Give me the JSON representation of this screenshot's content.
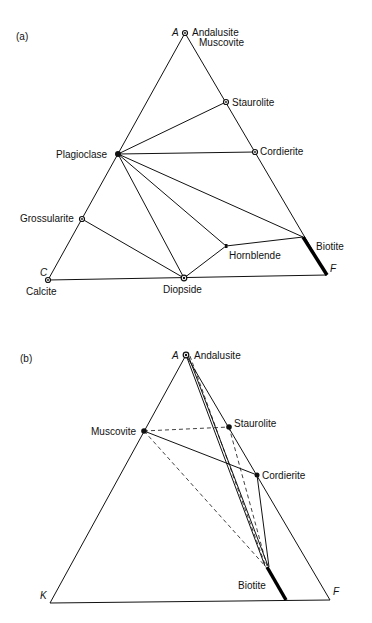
{
  "diagrams": [
    {
      "panel_label": "(a)",
      "vertices": {
        "top": "A",
        "left": "C",
        "right": "F"
      },
      "labels": {
        "andalusite": "Andalusite",
        "muscovite": "Muscovite",
        "staurolite": "Staurolite",
        "cordierite": "Cordierite",
        "plagioclase": "Plagioclase",
        "grossularite": "Grossularite",
        "hornblende": "Hornblende",
        "biotite": "Biotite",
        "calcite": "Calcite",
        "diopside": "Diopside"
      }
    },
    {
      "panel_label": "(b)",
      "vertices": {
        "top": "A",
        "left": "K",
        "right": "F"
      },
      "labels": {
        "andalusite": "Andalusite",
        "muscovite": "Muscovite",
        "staurolite": "Staurolite",
        "cordierite": "Cordierite",
        "biotite": "Biotite"
      }
    }
  ]
}
